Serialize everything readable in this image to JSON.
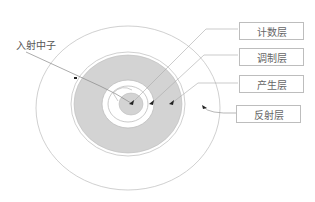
{
  "diagram": {
    "incident_label": "入射中子",
    "layers": [
      {
        "label": "计数层"
      },
      {
        "label": "调制层"
      },
      {
        "label": "产生层"
      },
      {
        "label": "反射层"
      }
    ],
    "colors": {
      "outline": "#bdbdbd",
      "shaded": "#d3d3d3",
      "text": "#666666",
      "arrow": "#222222"
    }
  }
}
